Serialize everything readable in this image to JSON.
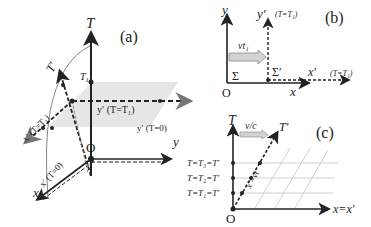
{
  "panel_a": {
    "tag": "(a)",
    "axis_T": "T",
    "axis_T_prime": "T'",
    "axis_y": "y",
    "axis_x": "x",
    "origin": "O",
    "T1_label": "T",
    "T1_sub": "1",
    "x_prime_T1": "x′ (T=T₁)",
    "y_prime_T1": "y′ (T=T₁)",
    "y_prime_T0": "y′ (T=0)",
    "x_prime_T0": "x′ (T=0)"
  },
  "panel_b": {
    "tag": "(b)",
    "axis_y": "y",
    "axis_y_prime": "y′",
    "y_prime_cond": "(T=T₁)",
    "axis_x": "x",
    "axis_x_prime": "x′",
    "x_prime_cond": "(T=T₁)",
    "origin": "O",
    "sigma": "Σ",
    "sigma_prime": "Σ′",
    "displacement": "vt₁"
  },
  "panel_c": {
    "tag": "(c)",
    "axis_T": "T",
    "axis_T_prime": "T'",
    "axis_x": "x=x′",
    "origin": "O",
    "slope": "v/c",
    "line_label": "x′=vt",
    "rows": [
      "T=T₃=T′",
      "T=T₂=T′",
      "T=T₁=T′"
    ]
  },
  "colors": {
    "axis": "#222222",
    "plane": "#e3e3e3",
    "grid": "#bdbdbd",
    "arrow_fill": "#cfcfcf"
  }
}
